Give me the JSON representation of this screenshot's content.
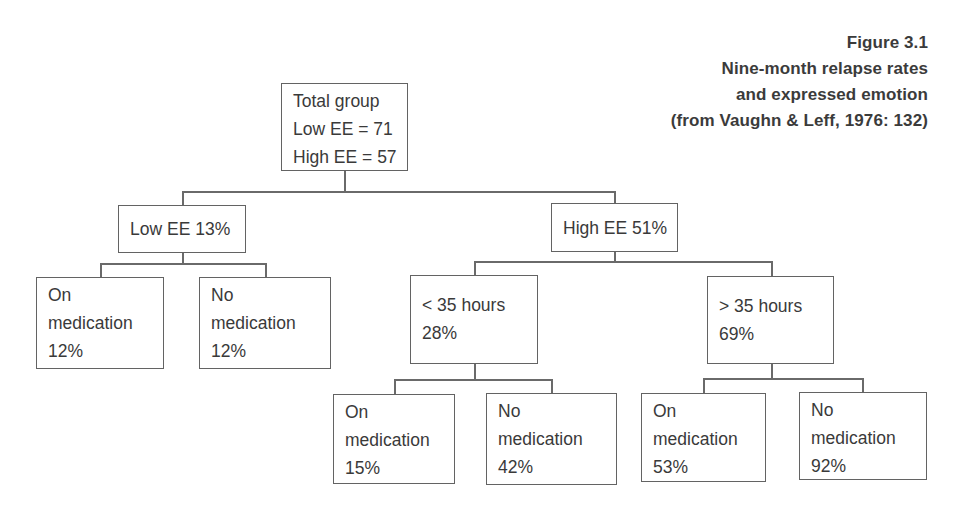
{
  "caption": {
    "lines": [
      "Figure 3.1",
      "Nine-month relapse rates",
      "and expressed emotion",
      "(from Vaughn & Leff, 1976: 132)"
    ]
  },
  "nodes": {
    "total_group": {
      "lines": [
        "Total group",
        "Low EE = 71",
        "High EE = 57"
      ]
    },
    "low_ee": {
      "lines": [
        "Low EE 13%"
      ]
    },
    "high_ee": {
      "lines": [
        "High EE 51%"
      ]
    },
    "low_on_medication": {
      "lines": [
        "On",
        "medication",
        "12%"
      ]
    },
    "low_no_medication": {
      "lines": [
        "No",
        "medication",
        "12%"
      ]
    },
    "under_35_hours": {
      "lines": [
        "< 35 hours",
        "28%"
      ]
    },
    "over_35_hours": {
      "lines": [
        "> 35 hours",
        "69%"
      ]
    },
    "under35_on_medication": {
      "lines": [
        "On",
        "medication",
        "15%"
      ]
    },
    "under35_no_medication": {
      "lines": [
        "No",
        "medication",
        "42%"
      ]
    },
    "over35_on_medication": {
      "lines": [
        "On",
        "medication",
        "53%"
      ]
    },
    "over35_no_medication": {
      "lines": [
        "No",
        "medication",
        "92%"
      ]
    }
  },
  "colors": {
    "ink": "#3a3a3a",
    "connector": "#6a6a6a",
    "background": "#ffffff"
  }
}
